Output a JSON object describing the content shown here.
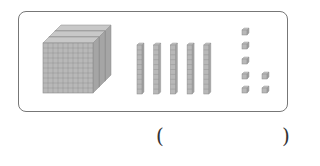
{
  "diagram": {
    "hundreds_flats": 3,
    "tens_rods": 5,
    "ones_cubes": 7,
    "block_color": "#b8b8b8",
    "line_color": "#8a8a8a"
  },
  "answer": {
    "open_paren": "(",
    "value": "",
    "close_paren": ")"
  }
}
